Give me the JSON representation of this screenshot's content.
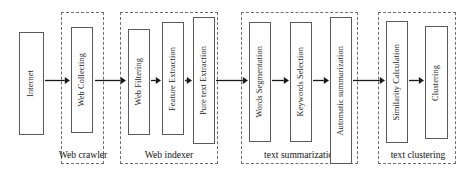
{
  "diagram": {
    "canvas": {
      "width": 476,
      "height": 185,
      "background": "#ffffff"
    },
    "stroke_colors": {
      "box": "#5a5a5a",
      "group": "#6e6e6e",
      "arrow": "#1a1a1a",
      "text": "#141414"
    },
    "source_node": {
      "id": "internet",
      "label": "Internet",
      "x": 19,
      "y": 32,
      "w": 25,
      "h": 103
    },
    "groups": [
      {
        "id": "web-crawler",
        "label": "Web crawler",
        "x": 61,
        "y": 12,
        "w": 43,
        "h": 152,
        "label_x": 55,
        "label_y": 149,
        "label_w": 56,
        "nodes": [
          {
            "id": "web-collecting",
            "label": "Web Collecting",
            "x": 71,
            "y": 27,
            "w": 22,
            "h": 106
          }
        ]
      },
      {
        "id": "web-indexer",
        "label": "Web indexer",
        "x": 120,
        "y": 12,
        "w": 98,
        "h": 152,
        "label_x": 128,
        "label_y": 149,
        "label_w": 82,
        "nodes": [
          {
            "id": "web-filtering",
            "label": "Web Filtering",
            "x": 128,
            "y": 29,
            "w": 22,
            "h": 106
          },
          {
            "id": "feature-extraction",
            "label": "Feature Extraction",
            "x": 162,
            "y": 22,
            "w": 22,
            "h": 113
          },
          {
            "id": "pure-text-extraction",
            "label": "Pure text Extraction",
            "x": 193,
            "y": 17,
            "w": 22,
            "h": 127
          }
        ]
      },
      {
        "id": "text-summarization",
        "label": "text summarization",
        "x": 241,
        "y": 12,
        "w": 117,
        "h": 152,
        "label_x": 243,
        "label_y": 149,
        "label_w": 116,
        "nodes": [
          {
            "id": "words-segmentation",
            "label": "Words Segmentation",
            "x": 249,
            "y": 22,
            "w": 22,
            "h": 120
          },
          {
            "id": "keywords-selection",
            "label": "Keywords Selection",
            "x": 290,
            "y": 22,
            "w": 22,
            "h": 120
          },
          {
            "id": "automatic-summarization",
            "label": "Automatic summarization",
            "x": 330,
            "y": 17,
            "w": 22,
            "h": 147
          }
        ]
      },
      {
        "id": "text-clustering",
        "label": "text clustering",
        "x": 378,
        "y": 12,
        "w": 78,
        "h": 152,
        "label_x": 380,
        "label_y": 149,
        "label_w": 76,
        "nodes": [
          {
            "id": "similarity-calculation",
            "label": "Similarity Calculation",
            "x": 386,
            "y": 21,
            "w": 22,
            "h": 122
          },
          {
            "id": "clustering",
            "label": "Clustering",
            "x": 425,
            "y": 26,
            "w": 23,
            "h": 113
          }
        ]
      }
    ],
    "arrows": [
      {
        "id": "arrow-internet-to-web-collecting",
        "x": 45,
        "y": 76,
        "w": 25
      },
      {
        "id": "arrow-web-collecting-to-web-filtering",
        "x": 95,
        "y": 76,
        "w": 31
      },
      {
        "id": "arrow-web-filtering-to-feature-extraction",
        "x": 151,
        "y": 76,
        "w": 10
      },
      {
        "id": "arrow-feature-extraction-to-pure-text-extraction",
        "x": 185,
        "y": 76,
        "w": 7
      },
      {
        "id": "arrow-pure-text-extraction-to-words-segmentation",
        "x": 216,
        "y": 76,
        "w": 32
      },
      {
        "id": "arrow-words-segmentation-to-keywords-selection",
        "x": 272,
        "y": 76,
        "w": 17
      },
      {
        "id": "arrow-keywords-selection-to-automatic-summarization",
        "x": 313,
        "y": 76,
        "w": 16
      },
      {
        "id": "arrow-automatic-summarization-to-similarity-calculation",
        "x": 353,
        "y": 76,
        "w": 32
      },
      {
        "id": "arrow-similarity-calculation-to-clustering",
        "x": 409,
        "y": 76,
        "w": 15
      }
    ]
  }
}
